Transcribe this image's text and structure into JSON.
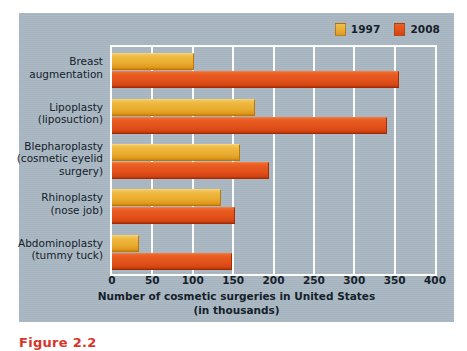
{
  "chart_data": {
    "type": "bar",
    "orientation": "horizontal",
    "title": "",
    "xlabel": "Number of cosmetic surgeries in United States\n(in thousands)",
    "ylabel": "",
    "xlim": [
      0,
      400
    ],
    "xticks": [
      0,
      50,
      100,
      150,
      200,
      250,
      300,
      350,
      400
    ],
    "grid": "vertical",
    "legend_position": "top-right",
    "categories": [
      "Breast\naugmentation",
      "Lipoplasty\n(liposuction)",
      "Blepharoplasty\n(cosmetic eyelid\nsurgery)",
      "Rhinoplasty\n(nose job)",
      "Abdominoplasty\n(tummy tuck)"
    ],
    "series": [
      {
        "name": "1997",
        "color": "#e9ab2e",
        "values": [
          101,
          177,
          159,
          135,
          34
        ]
      },
      {
        "name": "2008",
        "color": "#e1501a",
        "values": [
          355,
          341,
          195,
          152,
          148
        ]
      }
    ]
  },
  "legend": {
    "entries": [
      {
        "label": "1997",
        "color": "#e9ab2e"
      },
      {
        "label": "2008",
        "color": "#e1501a"
      }
    ]
  },
  "axis": {
    "ticks": [
      "0",
      "50",
      "100",
      "150",
      "200",
      "250",
      "300",
      "350",
      "400"
    ],
    "title": "Number of cosmetic surgeries in United States\n(in thousands)"
  },
  "caption": {
    "text": "Figure 2.2"
  },
  "colors": {
    "panel_background": "#a9b7c2",
    "page_background": "#ffffff",
    "grid": "#ffffff",
    "series_1997": "#e9ab2e",
    "series_2008": "#e1501a",
    "text": "#15212b",
    "caption": "#d8342a"
  }
}
